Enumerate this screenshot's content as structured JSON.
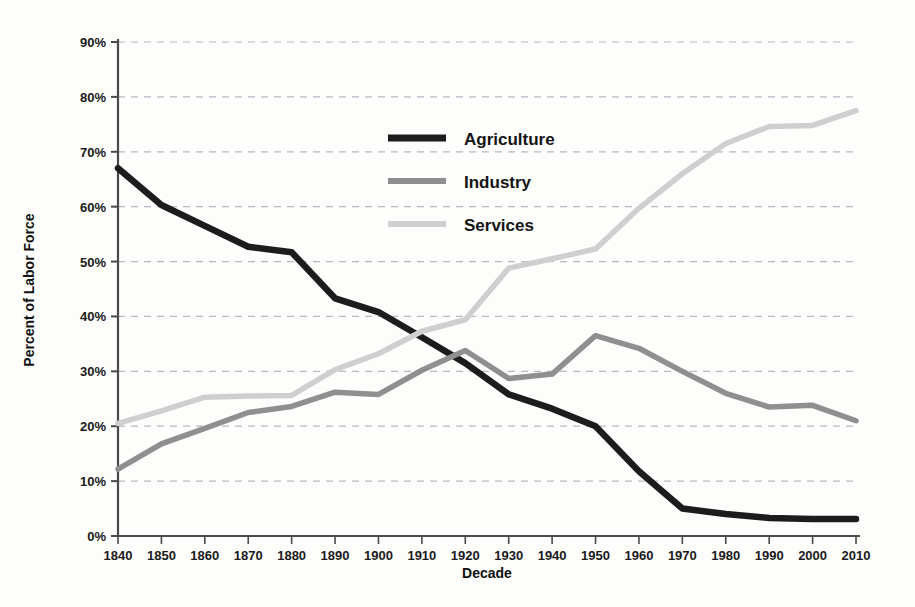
{
  "chart_data": {
    "type": "line",
    "title": "",
    "xlabel": "Decade",
    "ylabel": "Percent of Labor Force",
    "categories": [
      "1840",
      "1850",
      "1860",
      "1870",
      "1880",
      "1890",
      "1900",
      "1910",
      "1920",
      "1930",
      "1940",
      "1950",
      "1960",
      "1970",
      "1980",
      "1990",
      "2000",
      "2010"
    ],
    "xlim": [
      1840,
      2010
    ],
    "ylim": [
      0,
      90
    ],
    "ytick_values": [
      0,
      10,
      20,
      30,
      40,
      50,
      60,
      70,
      80,
      90
    ],
    "ytick_labels": [
      "0%",
      "10%",
      "20%",
      "30%",
      "40%",
      "50%",
      "60%",
      "70%",
      "80%",
      "90%"
    ],
    "grid": "horizontal-dashed",
    "legend_position": "upper-center",
    "series": [
      {
        "name": "Agriculture",
        "color": "#1c1c1c",
        "values": [
          67.0,
          60.3,
          56.5,
          52.7,
          51.7,
          43.3,
          40.8,
          36.2,
          31.5,
          25.8,
          23.2,
          20.0,
          11.8,
          5.0,
          4.0,
          3.3,
          3.1,
          3.1
        ]
      },
      {
        "name": "Industry",
        "color": "#8f8f8f",
        "values": [
          12.2,
          16.8,
          19.6,
          22.5,
          23.6,
          26.2,
          25.8,
          30.2,
          33.8,
          28.7,
          29.5,
          36.5,
          34.2,
          30.0,
          26.0,
          23.5,
          23.8,
          21.0
        ]
      },
      {
        "name": "Services",
        "color": "#cfcfcf",
        "values": [
          20.5,
          22.8,
          25.3,
          25.5,
          25.6,
          30.3,
          33.2,
          37.3,
          39.4,
          48.8,
          50.5,
          52.3,
          59.7,
          66.0,
          71.5,
          74.6,
          74.8,
          77.5
        ]
      }
    ]
  },
  "legend": {
    "items": [
      {
        "label": "Agriculture",
        "color": "#1c1c1c",
        "thickness": 7
      },
      {
        "label": "Industry",
        "color": "#8f8f8f",
        "thickness": 6
      },
      {
        "label": "Services",
        "color": "#cfcfcf",
        "thickness": 6
      }
    ]
  },
  "axes": {
    "y_title": "Percent of Labor Force",
    "x_title": "Decade"
  },
  "style": {
    "background": "#fdfdfb",
    "axis_color": "#4a4a4a",
    "grid_color": "#b9b9c4",
    "tick_label_color": "#1a1a1a"
  }
}
